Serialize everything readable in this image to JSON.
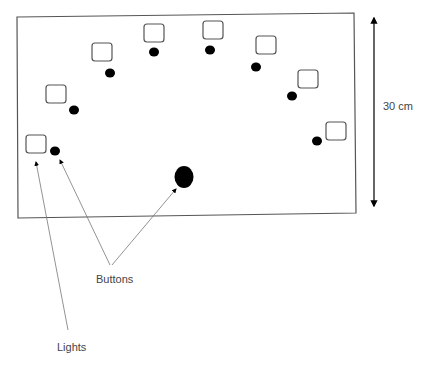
{
  "diagram": {
    "title": "",
    "dimension_label": "30 cm",
    "labels": {
      "buttons": "Buttons",
      "lights": "Lights"
    },
    "lights_count": 8,
    "buttons_count": 9,
    "colors": {
      "outline": "#555555",
      "fill": "#000000",
      "text": "#444444"
    }
  }
}
